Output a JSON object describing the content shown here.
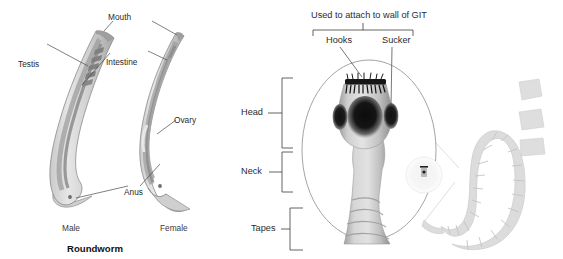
{
  "figure": {
    "title_caption": "Roundworm",
    "background_color": "#ffffff",
    "leader_line_color": "#444444",
    "body_fill_light": "#d9d9d9",
    "body_fill_mid": "#bfbfbf",
    "body_fill_dark": "#8f8f8f",
    "sucker_color": "#111111",
    "tapeworm_body_color": "#d8d8d8"
  },
  "roundworm": {
    "labels": {
      "mouth": "Mouth",
      "testis": "Testis",
      "intestine": "Intestine",
      "ovary": "Ovary",
      "anus": "Anus"
    },
    "captions": {
      "male": "Male",
      "female": "Female"
    },
    "group_caption": "Roundworm"
  },
  "tapeworm": {
    "top_label": "Used to attach to wall of GIT",
    "attachment_parts": {
      "hooks": "Hooks",
      "sucker": "Sucker"
    },
    "regions": {
      "head": "Head",
      "neck": "Neck",
      "tapes": "Tapes"
    }
  }
}
